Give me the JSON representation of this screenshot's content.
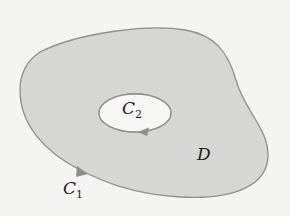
{
  "figure": {
    "colors": {
      "background": "#f4f4f3",
      "region_fill": "#d6d6d5",
      "outline": "#8e8e8e",
      "hole_fill": "#f7f7f6",
      "text": "#1e1e1e"
    },
    "labels": {
      "inner_curve": {
        "main": "C",
        "sub": "2"
      },
      "region": "D",
      "outer_curve": {
        "main": "C",
        "sub": "1"
      }
    },
    "arrows": {
      "inner_curve_direction": "clockwise",
      "outer_curve_direction": "counterclockwise"
    }
  }
}
